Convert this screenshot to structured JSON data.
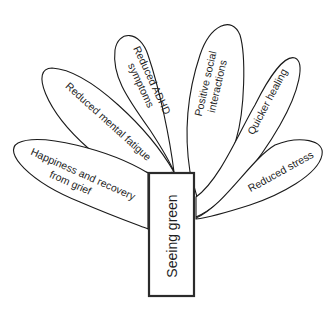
{
  "diagram": {
    "center": {
      "label": "Seeing green"
    },
    "petals": [
      {
        "id": "happiness",
        "lines": [
          "Happiness and recovery",
          "from grief"
        ]
      },
      {
        "id": "mental-fatigue",
        "lines": [
          "Reduced mental fatigue"
        ]
      },
      {
        "id": "adhd",
        "lines": [
          "Reduced ADHD",
          "symptoms"
        ]
      },
      {
        "id": "social",
        "lines": [
          "Positive social",
          "interactions"
        ]
      },
      {
        "id": "healing",
        "lines": [
          "Quicker healing"
        ]
      },
      {
        "id": "stress",
        "lines": [
          "Reduced stress"
        ]
      }
    ],
    "colors": {
      "stroke": "#1a1a1a",
      "background": "#ffffff",
      "text": "#1e1e1e"
    }
  }
}
